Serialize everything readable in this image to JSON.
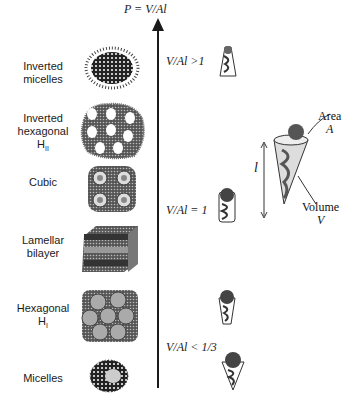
{
  "axis": {
    "title": "P = V/Al",
    "markers": [
      {
        "label": "V/Al >1",
        "y": 61
      },
      {
        "label": "V/Al = 1",
        "y": 203
      },
      {
        "label": "V/Al < 1/3",
        "y": 344
      }
    ]
  },
  "phases": [
    {
      "name": "Inverted micelles",
      "line1": "Inverted",
      "line2": "micelles",
      "sub": ""
    },
    {
      "name": "Inverted hexagonal HII",
      "line1": "Inverted",
      "line2": "hexagonal",
      "line3": "H",
      "sub": "II"
    },
    {
      "name": "Cubic",
      "line1": "Cubic"
    },
    {
      "name": "Lamellar bilayer",
      "line1": "Lamellar",
      "line2": "bilayer"
    },
    {
      "name": "Hexagonal HI",
      "line1": "Hexagonal",
      "line3": "H",
      "sub": "I"
    },
    {
      "name": "Micelles",
      "line1": "Micelles"
    }
  ],
  "molecule_legend": {
    "area_label": "Area",
    "area_symbol": "A",
    "volume_label": "Volume",
    "volume_symbol": "V",
    "length_symbol": "l"
  }
}
